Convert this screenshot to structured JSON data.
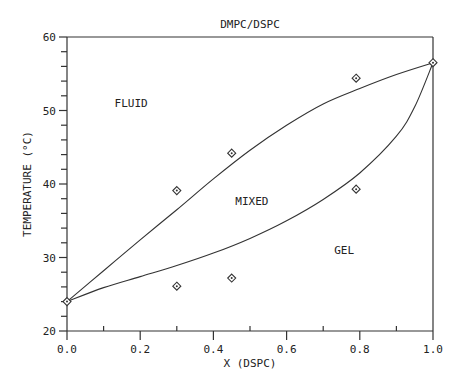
{
  "chart_data": {
    "type": "scatter",
    "title": "DMPC/DSPC",
    "xlabel": "X (DSPC)",
    "ylabel": "TEMPERATURE (°C)",
    "xlim": [
      0.0,
      1.0
    ],
    "ylim": [
      20,
      60
    ],
    "xticks": [
      "0.0",
      "0.2",
      "0.4",
      "0.6",
      "0.8",
      "1.0"
    ],
    "yticks": [
      "20",
      "30",
      "40",
      "50",
      "60"
    ],
    "grid": false,
    "legend": null,
    "annotations": [
      {
        "text": "FLUID",
        "x": 0.13,
        "y": 50.5
      },
      {
        "text": "MIXED",
        "x": 0.46,
        "y": 37.2
      },
      {
        "text": "GEL",
        "x": 0.73,
        "y": 30.5
      }
    ],
    "series": [
      {
        "name": "data points",
        "type": "scatter",
        "marker": "diamond",
        "points": [
          {
            "x": 0.0,
            "y": 24.0
          },
          {
            "x": 0.3,
            "y": 39.1
          },
          {
            "x": 0.3,
            "y": 26.1
          },
          {
            "x": 0.45,
            "y": 44.2
          },
          {
            "x": 0.45,
            "y": 27.2
          },
          {
            "x": 0.79,
            "y": 54.4
          },
          {
            "x": 0.79,
            "y": 39.3
          },
          {
            "x": 1.0,
            "y": 56.5
          }
        ]
      },
      {
        "name": "liquidus (upper boundary)",
        "type": "line",
        "points": [
          {
            "x": 0.0,
            "y": 24.0
          },
          {
            "x": 0.1,
            "y": 28.2
          },
          {
            "x": 0.2,
            "y": 32.4
          },
          {
            "x": 0.3,
            "y": 36.5
          },
          {
            "x": 0.4,
            "y": 40.7
          },
          {
            "x": 0.5,
            "y": 44.6
          },
          {
            "x": 0.6,
            "y": 48.0
          },
          {
            "x": 0.7,
            "y": 50.9
          },
          {
            "x": 0.8,
            "y": 53.0
          },
          {
            "x": 0.9,
            "y": 54.9
          },
          {
            "x": 1.0,
            "y": 56.5
          }
        ]
      },
      {
        "name": "solidus (lower boundary)",
        "type": "line",
        "points": [
          {
            "x": 0.0,
            "y": 24.0
          },
          {
            "x": 0.1,
            "y": 25.9
          },
          {
            "x": 0.2,
            "y": 27.4
          },
          {
            "x": 0.3,
            "y": 28.9
          },
          {
            "x": 0.4,
            "y": 30.6
          },
          {
            "x": 0.5,
            "y": 32.6
          },
          {
            "x": 0.6,
            "y": 35.0
          },
          {
            "x": 0.7,
            "y": 37.9
          },
          {
            "x": 0.8,
            "y": 41.5
          },
          {
            "x": 0.9,
            "y": 46.5
          },
          {
            "x": 0.95,
            "y": 50.5
          },
          {
            "x": 1.0,
            "y": 56.5
          }
        ]
      }
    ]
  }
}
